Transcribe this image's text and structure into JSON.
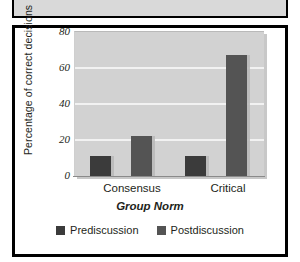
{
  "figure": {
    "caption_strip_text": "",
    "frame_color": "#000000"
  },
  "chart_data": {
    "type": "bar",
    "title": "",
    "categories": [
      "Consensus",
      "Critical"
    ],
    "series": [
      {
        "name": "Prediscussion",
        "values": [
          11,
          11
        ],
        "color": "#3b3b3b"
      },
      {
        "name": "Postdiscussion",
        "values": [
          22,
          67
        ],
        "color": "#545454"
      }
    ],
    "xlabel": "Group Norm",
    "ylabel": "Percentage of correct decisions",
    "ylim": [
      0,
      80
    ],
    "yticks": [
      0,
      20,
      40,
      60,
      80
    ],
    "ytick_labels": [
      "0",
      "20",
      "40",
      "60",
      "80"
    ],
    "grid": true,
    "grid_axis": "y",
    "legend_position": "bottom",
    "plot_background": "#d2d2d2",
    "gridline_color": "#f2f2f2"
  }
}
